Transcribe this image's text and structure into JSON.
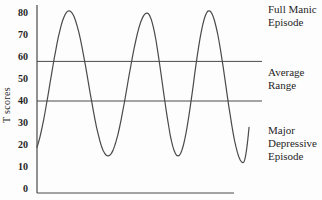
{
  "figure": {
    "background": "#fdfdfd",
    "line_color": "#4a4a4a",
    "text_color": "#1f1f1f"
  },
  "chart_data": {
    "type": "line",
    "title": "",
    "xlabel": "",
    "ylabel": "T scores",
    "ylim": [
      0,
      85
    ],
    "yticks": [
      80,
      70,
      60,
      50,
      40,
      30,
      20,
      10,
      0
    ],
    "grid": false,
    "legend": "none",
    "reference_lines": [
      {
        "name": "average-range-upper",
        "t": 58
      },
      {
        "name": "average-range-lower",
        "t": 40
      }
    ],
    "series": [
      {
        "name": "mood-cycle",
        "points": [
          {
            "u": 0.0,
            "t": 19
          },
          {
            "u": 0.151,
            "t": 81
          },
          {
            "u": 0.335,
            "t": 15
          },
          {
            "u": 0.519,
            "t": 80
          },
          {
            "u": 0.665,
            "t": 15
          },
          {
            "u": 0.811,
            "t": 81
          },
          {
            "u": 0.972,
            "t": 12
          },
          {
            "u": 1.0,
            "t": 28
          }
        ]
      }
    ],
    "annotations": [
      {
        "name": "full-manic-episode",
        "text": "Full Manic\nEpisode"
      },
      {
        "name": "average-range",
        "text": "Average\nRange"
      },
      {
        "name": "major-depressive-episode",
        "text": "Major\nDepressive\nEpisode"
      }
    ]
  }
}
